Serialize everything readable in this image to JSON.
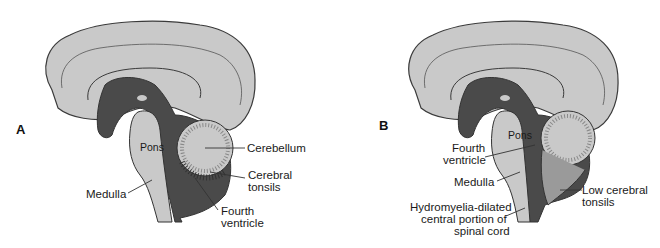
{
  "figure": {
    "colors": {
      "brain_tissue": "#c9c9c9",
      "csf_dark": "#4a4a4a",
      "outline": "#3a3a3a",
      "background": "#ffffff",
      "label_text": "#1a1a1a"
    }
  },
  "panels": [
    {
      "id": "A",
      "letter": "A",
      "labels": {
        "pons": "Pons",
        "medulla": "Medulla",
        "cerebellum": "Cerebellum",
        "tonsils_line1": "Cerebral",
        "tonsils_line2": "tonsils",
        "fourth_line1": "Fourth",
        "fourth_line2": "ventricle"
      }
    },
    {
      "id": "B",
      "letter": "B",
      "labels": {
        "pons": "Pons",
        "fourth_line1": "Fourth",
        "fourth_line2": "ventricle",
        "medulla": "Medulla",
        "tonsils_line1": "Low cerebral",
        "tonsils_line2": "tonsils",
        "hydro_line1": "Hydromyelia-dilated",
        "hydro_line2": "central portion of",
        "hydro_line3": "spinal cord"
      }
    }
  ]
}
